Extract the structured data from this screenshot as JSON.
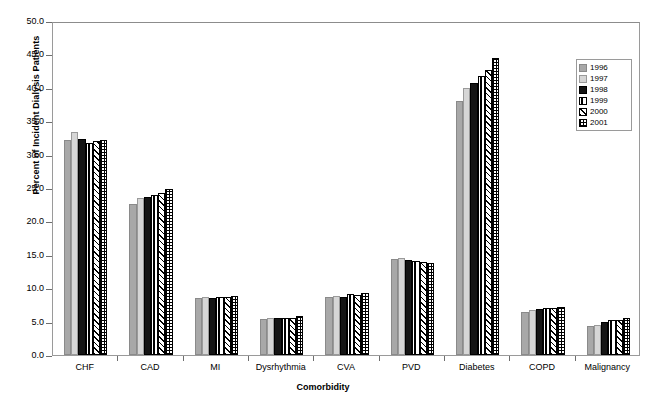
{
  "chart_data": {
    "type": "bar",
    "title": "",
    "xlabel": "Comorbidity",
    "ylabel": "Percent of Incident Dialysis Patients",
    "ylim": [
      0.0,
      50.0
    ],
    "ytick_labels": [
      "50.0",
      "45.0",
      "40.0",
      "35.0",
      "30.0",
      "25.0",
      "20.0",
      "15.0",
      "10.0",
      "5.0",
      "0.0"
    ],
    "ytick_values": [
      50.0,
      45.0,
      40.0,
      35.0,
      30.0,
      25.0,
      20.0,
      15.0,
      10.0,
      5.0,
      0.0
    ],
    "grid": false,
    "legend_position": "top-right",
    "categories": [
      "CHF",
      "CAD",
      "MI",
      "Dysrhythmia",
      "CVA",
      "PVD",
      "Diabetes",
      "COPD",
      "Malignancy"
    ],
    "series": [
      {
        "name": "1996",
        "pattern": "solid-medium-gray",
        "values": [
          32.2,
          22.6,
          8.6,
          5.4,
          8.7,
          14.4,
          38.1,
          6.4,
          4.3
        ]
      },
      {
        "name": "1997",
        "pattern": "solid-light-gray",
        "values": [
          33.4,
          23.5,
          8.7,
          5.6,
          8.9,
          14.5,
          39.9,
          6.8,
          4.5
        ]
      },
      {
        "name": "1998",
        "pattern": "solid-black",
        "values": [
          32.3,
          23.7,
          8.6,
          5.5,
          8.7,
          14.2,
          40.7,
          6.9,
          4.9
        ]
      },
      {
        "name": "1999",
        "pattern": "white-vertical-stripe",
        "values": [
          31.7,
          23.9,
          8.7,
          5.6,
          9.1,
          14.1,
          41.7,
          7.1,
          5.2
        ]
      },
      {
        "name": "2000",
        "pattern": "diagonal-hatch",
        "values": [
          32.0,
          24.3,
          8.7,
          5.6,
          9.0,
          13.9,
          42.7,
          7.1,
          5.3
        ]
      },
      {
        "name": "2001",
        "pattern": "checkerboard",
        "values": [
          32.2,
          24.8,
          8.8,
          5.9,
          9.3,
          13.8,
          44.4,
          7.2,
          5.6
        ]
      }
    ]
  },
  "legend": {
    "items": [
      {
        "label": "1996"
      },
      {
        "label": "1997"
      },
      {
        "label": "1998"
      },
      {
        "label": "1999"
      },
      {
        "label": "2000"
      },
      {
        "label": "2001"
      }
    ]
  }
}
